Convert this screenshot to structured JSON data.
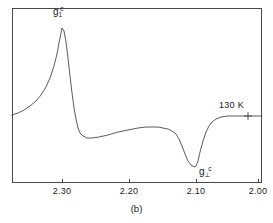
{
  "figure": {
    "caption": "(b)",
    "panel_id": "b"
  },
  "annotations": {
    "peak_label": {
      "base": "g",
      "sub": "1",
      "sup": "c",
      "text": "g1c"
    },
    "dip_label": {
      "base": "g",
      "sub": "⊥",
      "sup": "c",
      "text": "g⊥c"
    },
    "temperature": "130 K"
  },
  "axis": {
    "ticks": [
      {
        "label": "2.30",
        "value": 2.3,
        "x": 62
      },
      {
        "label": "2.20",
        "value": 2.2,
        "x": 129
      },
      {
        "label": "2.10",
        "value": 2.1,
        "x": 196
      },
      {
        "label": "2.00",
        "value": 2.0,
        "x": 258
      }
    ]
  },
  "chart_data": {
    "type": "line",
    "title": "",
    "subtitle": "",
    "xlabel": "g-value",
    "ylabel": "EPR derivative signal (arb. units)",
    "xlim": [
      2.335,
      1.99
    ],
    "ylim": [
      -1.05,
      1.0
    ],
    "x_inverted": true,
    "grid": false,
    "legend": null,
    "tick_labels": [
      "2.30",
      "2.20",
      "2.10",
      "2.00"
    ],
    "tick_values": [
      2.3,
      2.2,
      2.1,
      2.0
    ],
    "annotations": [
      {
        "text": "g1c",
        "g": 2.293,
        "kind": "peak-label"
      },
      {
        "text": "g⊥c",
        "g": 2.072,
        "kind": "dip-label"
      },
      {
        "text": "130 K",
        "g": 2.02,
        "kind": "temperature-label"
      }
    ],
    "markers": [
      {
        "type": "cross",
        "g": 2.011,
        "y": 0.0,
        "x_px": 248,
        "y_px": 116
      }
    ],
    "series": [
      {
        "name": "EPR derivative spectrum at 130 K",
        "points_px": [
          [
            12,
            115
          ],
          [
            18,
            113
          ],
          [
            24,
            110
          ],
          [
            30,
            106
          ],
          [
            36,
            101
          ],
          [
            41,
            95
          ],
          [
            46,
            87
          ],
          [
            50,
            78
          ],
          [
            54,
            66
          ],
          [
            57,
            54
          ],
          [
            59,
            43
          ],
          [
            61,
            33
          ],
          [
            62,
            28
          ],
          [
            64,
            31
          ],
          [
            66,
            42
          ],
          [
            68,
            58
          ],
          [
            70,
            76
          ],
          [
            72,
            93
          ],
          [
            74,
            108
          ],
          [
            76,
            119
          ],
          [
            78,
            128
          ],
          [
            80,
            133
          ],
          [
            83,
            136
          ],
          [
            87,
            138
          ],
          [
            92,
            138
          ],
          [
            99,
            137
          ],
          [
            108,
            135
          ],
          [
            118,
            132
          ],
          [
            128,
            130
          ],
          [
            138,
            128
          ],
          [
            146,
            127
          ],
          [
            152,
            127
          ],
          [
            158,
            127
          ],
          [
            163,
            128
          ],
          [
            168,
            129
          ],
          [
            172,
            131
          ],
          [
            176,
            134
          ],
          [
            179,
            139
          ],
          [
            182,
            146
          ],
          [
            185,
            154
          ],
          [
            188,
            161
          ],
          [
            191,
            165
          ],
          [
            194,
            167
          ],
          [
            196,
            166
          ],
          [
            198,
            161
          ],
          [
            200,
            152
          ],
          [
            203,
            141
          ],
          [
            206,
            132
          ],
          [
            209,
            126
          ],
          [
            212,
            122
          ],
          [
            216,
            119
          ],
          [
            221,
            117
          ],
          [
            227,
            116
          ],
          [
            234,
            116
          ],
          [
            242,
            116
          ],
          [
            250,
            116
          ],
          [
            258,
            116
          ],
          [
            262,
            116
          ]
        ],
        "peak_px": [
          62,
          28
        ],
        "dip_px": [
          196,
          167
        ],
        "baseline_px": 116
      }
    ]
  },
  "colors": {
    "curve": "#4a4a4a",
    "frame": "#4a4a4a",
    "text": "#1a1a1a",
    "background": "#ffffff"
  }
}
